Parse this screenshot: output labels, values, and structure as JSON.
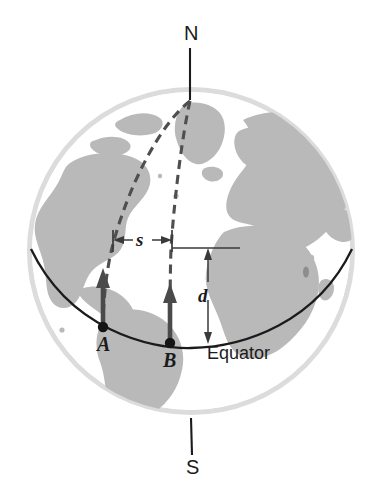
{
  "figure": {
    "type": "physics-geometry-diagram"
  },
  "labels": {
    "north_pole": "N",
    "south_pole": "S",
    "point_a": "A",
    "point_b": "B",
    "arc_distance": "s",
    "vertical_distance": "d",
    "equator": "Equator"
  },
  "colors": {
    "land": "#b9b9b9",
    "ocean": "#ffffff",
    "globe_rim": "#d8d8d8",
    "line_dark": "#1b1b1b",
    "arrow": "#4a4a4a",
    "dashed": "#4f4f4f",
    "text": "#1b1b1b"
  },
  "geometry": {
    "globe_center_x": 191,
    "globe_center_y": 251,
    "globe_radius": 162,
    "point_a": {
      "x": 103,
      "y": 327
    },
    "point_b": {
      "x": 170,
      "y": 343
    },
    "north_pole_tip": {
      "x": 190,
      "y": 100
    },
    "axis_top_y": 48,
    "axis_bottom_y": 455,
    "equator_left": {
      "x": 31,
      "y": 249
    },
    "equator_right": {
      "x": 352,
      "y": 249
    },
    "s_measure_y": 240,
    "d_measure_x": 208
  },
  "elements": [
    {
      "name": "globe-sphere",
      "kind": "circle"
    },
    {
      "name": "landmasses",
      "kind": "map-silhouette"
    },
    {
      "name": "equator-arc",
      "kind": "curve"
    },
    {
      "name": "polar-axis",
      "kind": "line"
    },
    {
      "name": "meridian-a",
      "kind": "dashed-curve"
    },
    {
      "name": "meridian-b",
      "kind": "dashed-curve"
    },
    {
      "name": "arrow-a",
      "kind": "arrow"
    },
    {
      "name": "arrow-b",
      "kind": "arrow"
    },
    {
      "name": "s-dimension",
      "kind": "double-arrow"
    },
    {
      "name": "d-dimension",
      "kind": "double-arrow"
    }
  ]
}
